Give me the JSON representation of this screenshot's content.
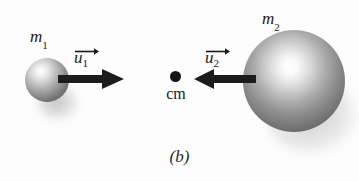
{
  "figure": {
    "caption": "(b)",
    "background_color": "#fdfdfd",
    "ink_color": "#1a1a1a",
    "description_type": "physics-diagram-center-of-mass-collision"
  },
  "bodies": [
    {
      "id": "m1",
      "mass_label_base": "m",
      "mass_label_sub": "1",
      "size": "small",
      "sphere_color_light": "#ffffff",
      "sphere_color_dark": "#5c5c5c"
    },
    {
      "id": "m2",
      "mass_label_base": "m",
      "mass_label_sub": "2",
      "size": "large",
      "sphere_color_light": "#ffffff",
      "sphere_color_dark": "#585858"
    }
  ],
  "vectors": [
    {
      "id": "u1",
      "label_base": "u",
      "label_sub": "1",
      "direction": "right",
      "arrow_color": "#1c1c1c",
      "accent_direction": "right"
    },
    {
      "id": "u2",
      "label_base": "u",
      "label_sub": "2",
      "direction": "left",
      "arrow_color": "#1c1c1c",
      "accent_direction": "right"
    }
  ],
  "center_of_mass": {
    "label": "cm",
    "dot_color": "#151515"
  }
}
